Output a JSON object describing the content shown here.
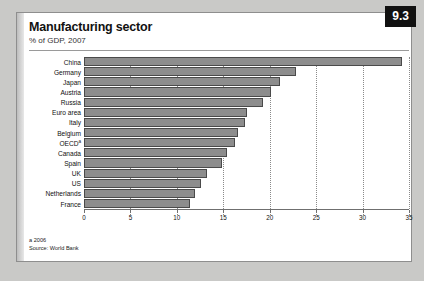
{
  "badge": {
    "number": "9.3"
  },
  "header": {
    "title": "Manufacturing sector",
    "subtitle": "% of GDP, 2007"
  },
  "footnotes": {
    "note": "a 2006",
    "source": "Source: World Bank"
  },
  "chart_data": {
    "type": "bar",
    "orientation": "horizontal",
    "title": "Manufacturing sector",
    "subtitle": "% of GDP, 2007",
    "xlabel": "",
    "ylabel": "",
    "xlim": [
      0,
      35
    ],
    "xticks": [
      "0",
      "5",
      "10",
      "15",
      "20",
      "25",
      "30",
      "35"
    ],
    "xtick_values": [
      0,
      5,
      10,
      15,
      20,
      25,
      30,
      35
    ],
    "grid": "vertical-dotted",
    "legend": "none",
    "bar_color": "#8d8d8d",
    "bar_edge_color": "#4a4a4a",
    "categories": [
      "China",
      "Germany",
      "Japan",
      "Austria",
      "Russia",
      "Euro area",
      "Italy",
      "Belgium",
      "OECD",
      "Canada",
      "Spain",
      "UK",
      "US",
      "Netherlands",
      "France"
    ],
    "category_footnote_marks": {
      "OECD": "a"
    },
    "values": [
      34.2,
      22.8,
      21.1,
      20.1,
      19.3,
      17.5,
      17.3,
      16.6,
      16.3,
      15.4,
      14.9,
      13.2,
      12.6,
      12.0,
      11.4
    ],
    "source": "World Bank",
    "note": "a 2006"
  }
}
